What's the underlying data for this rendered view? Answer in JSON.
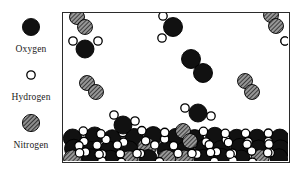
{
  "figure": {
    "vessel": {
      "name": "container",
      "border_color": "#2b2b2b",
      "background": "#ffffff",
      "width": 228,
      "height": 151
    }
  },
  "legend": {
    "items": [
      {
        "key": "oxygen",
        "label": "Oxygen",
        "icon": "filled-circle-icon",
        "fill": "#111111",
        "stroke": "#000000",
        "radius": 8.5
      },
      {
        "key": "hydrogen",
        "label": "Hydrogen",
        "icon": "open-circle-icon",
        "fill": "#ffffff",
        "stroke": "#000000",
        "radius": 4.2
      },
      {
        "key": "nitrogen",
        "label": "Nitrogen",
        "icon": "hatched-circle-icon",
        "fill": "#9a9a9a",
        "stroke": "#000000",
        "radius": 8.5
      }
    ]
  },
  "colors": {
    "oxygen": "#111111",
    "hydrogen": "#ffffff",
    "nitrogen": "#9a9a9a",
    "outline": "#000000",
    "vessel_border": "#2b2b2b",
    "page_background": "#ffffff"
  },
  "scene": {
    "description": "Gas phase above a dense liquid water layer; O2 and N2 diatomic molecules in the vapour, water molecules (one oxygen + two hydrogens) throughout.",
    "phases": [
      {
        "name": "gas",
        "y_range": [
          0,
          118
        ]
      },
      {
        "name": "liquid",
        "y_range": [
          118,
          151
        ]
      }
    ],
    "gas_molecules": [
      {
        "type": "N2",
        "atoms": [
          {
            "el": "N",
            "x": 14,
            "y": 4,
            "r": 7.5
          },
          {
            "el": "N",
            "x": 22,
            "y": 14,
            "r": 7.5
          }
        ]
      },
      {
        "type": "H2O",
        "atoms": [
          {
            "el": "O",
            "x": 22,
            "y": 36,
            "r": 9
          },
          {
            "el": "H",
            "x": 10,
            "y": 28,
            "r": 4.2
          },
          {
            "el": "H",
            "x": 35,
            "y": 28,
            "r": 4.2
          }
        ]
      },
      {
        "type": "H2O",
        "atoms": [
          {
            "el": "O",
            "x": 110,
            "y": 14,
            "r": 9.5
          },
          {
            "el": "H",
            "x": 100,
            "y": 3,
            "r": 4.2
          },
          {
            "el": "H",
            "x": 99,
            "y": 25,
            "r": 4.2
          }
        ]
      },
      {
        "type": "O2",
        "atoms": [
          {
            "el": "O",
            "x": 128,
            "y": 46,
            "r": 9.5
          },
          {
            "el": "O",
            "x": 140,
            "y": 60,
            "r": 9.5
          }
        ]
      },
      {
        "type": "N2",
        "atoms": [
          {
            "el": "N",
            "x": 208,
            "y": 2,
            "r": 7.5
          },
          {
            "el": "N",
            "x": 213,
            "y": 13,
            "r": 7.5
          }
        ]
      },
      {
        "type": "N2",
        "atoms": [
          {
            "el": "N",
            "x": 182,
            "y": 68,
            "r": 7.5
          },
          {
            "el": "N",
            "x": 189,
            "y": 79,
            "r": 7.5
          }
        ]
      },
      {
        "type": "N2",
        "atoms": [
          {
            "el": "N",
            "x": 24,
            "y": 70,
            "r": 7.5
          },
          {
            "el": "N",
            "x": 33,
            "y": 79,
            "r": 7.5
          }
        ]
      },
      {
        "type": "H2O",
        "atoms": [
          {
            "el": "O",
            "x": 222,
            "y": 28,
            "r": 4.2
          },
          {
            "el": "H",
            "x": 222,
            "y": 28,
            "r": 4.2
          }
        ]
      },
      {
        "type": "H2O",
        "atoms": [
          {
            "el": "O",
            "x": 135,
            "y": 100,
            "r": 9
          },
          {
            "el": "H",
            "x": 122,
            "y": 95,
            "r": 4.2
          },
          {
            "el": "H",
            "x": 148,
            "y": 103,
            "r": 4.2
          }
        ]
      },
      {
        "type": "H2O",
        "atoms": [
          {
            "el": "O",
            "x": 60,
            "y": 112,
            "r": 9
          },
          {
            "el": "H",
            "x": 51,
            "y": 102,
            "r": 4.2
          },
          {
            "el": "H",
            "x": 72,
            "y": 108,
            "r": 4.2
          }
        ]
      },
      {
        "type": "N2",
        "atoms": [
          {
            "el": "N",
            "x": 120,
            "y": 118,
            "r": 7.5
          },
          {
            "el": "N",
            "x": 127,
            "y": 128,
            "r": 7.5
          }
        ]
      }
    ]
  }
}
